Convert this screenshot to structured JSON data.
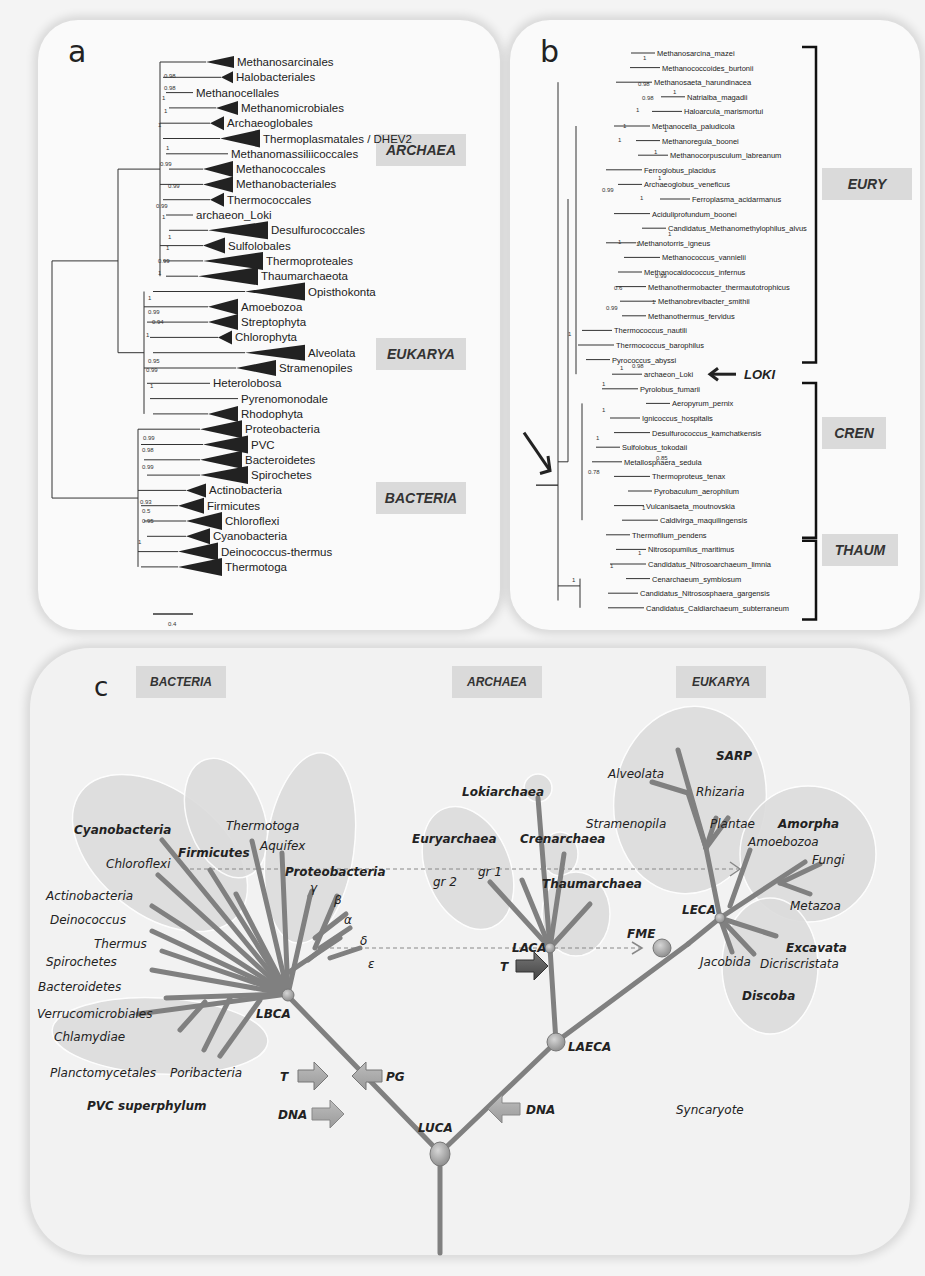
{
  "panel_a": {
    "letter": "a",
    "domains": [
      "ARCHAEA",
      "EUKARYA",
      "BACTERIA"
    ],
    "taxa": [
      "Methanosarcinales",
      "Halobacteriales",
      "Methanocellales",
      "Methanomicrobiales",
      "Archaeoglobales",
      "Thermoplasmatales / DHEV2",
      "Methanomassiliicoccales",
      "Methanococcales",
      "Methanobacteriales",
      "Thermococcales",
      "archaeon_Loki",
      "Desulfurococcales",
      "Sulfolobales",
      "Thermoproteales",
      "Thaumarchaeota",
      "Opisthokonta",
      "Amoebozoa",
      "Streptophyta",
      "Chlorophyta",
      "Alveolata",
      "Stramenopiles",
      "Heterolobosa",
      "Pyrenomonodale",
      "Rhodophyta",
      "Proteobacteria",
      "PVC",
      "Bacteroidetes",
      "Spirochetes",
      "Actinobacteria",
      "Firmicutes",
      "Chloroflexi",
      "Cyanobacteria",
      "Deinococcus-thermus",
      "Thermotoga"
    ],
    "supports": [
      "0.98",
      "0.98",
      "1",
      "1",
      "1",
      "1",
      "0.99",
      "0.99",
      "0.99",
      "1",
      "1",
      "1",
      "0.99",
      "1",
      "1",
      "0.99",
      "0.94",
      "1",
      "0.95",
      "0.99",
      "1",
      "0.99",
      "0.98",
      "0.99",
      "0.93",
      "0.5",
      "0.95",
      "1"
    ],
    "scale_label": "0.4"
  },
  "panel_b": {
    "letter": "b",
    "groups": [
      "EURY",
      "CREN",
      "THAUM"
    ],
    "loki_label": "LOKI",
    "taxa": [
      "Methanosarcina_mazei",
      "Methanococcoides_burtonii",
      "Methanosaeta_harundinacea",
      "Natrialba_magadii",
      "Haloarcula_marismortui",
      "Methanocella_paludicola",
      "Methanoregula_boonei",
      "Methanocorpusculum_labreanum",
      "Ferroglobus_placidus",
      "Archaeoglobus_veneficus",
      "Ferroplasma_acidarmanus",
      "Aciduliprofundum_boonei",
      "Candidatus_Methanomethylophilus_alvus",
      "Methanotorris_igneus",
      "Methanococcus_vannielii",
      "Methanocaldococcus_infernus",
      "Methanothermobacter_thermautotrophicus",
      "Methanobrevibacter_smithii",
      "Methanothermus_fervidus",
      "Thermococcus_nautili",
      "Thermococcus_barophilus",
      "Pyrococcus_abyssi",
      "archaeon_Loki",
      "Pyrolobus_fumarii",
      "Aeropyrum_pernix",
      "Ignicoccus_hospitalis",
      "Desulfurococcus_kamchatkensis",
      "Sulfolobus_tokodaii",
      "Metallosphaera_sedula",
      "Thermoproteus_tenax",
      "Pyrobaculum_aerophilum",
      "Vulcanisaeta_moutnovskia",
      "Caldivirga_maquilingensis",
      "Thermofilum_pendens",
      "Nitrosopumilus_maritimus",
      "Candidatus_Nitrosoarchaeum_limnia",
      "Cenarchaeum_symbiosum",
      "Candidatus_Nitrososphaera_gargensis",
      "Candidatus_Caldiarchaeum_subterraneum"
    ],
    "supports": [
      "1",
      "0.98",
      "0.98",
      "1",
      "1",
      "1",
      "1",
      "1",
      "1",
      "1",
      "1",
      "0.99",
      "1",
      "1",
      "1",
      "0.99",
      "0.6",
      "1",
      "0.99",
      "1",
      "0.98",
      "1",
      "1",
      "1",
      "1",
      "0.78",
      "0.85",
      "1",
      "1",
      "1",
      "1"
    ]
  },
  "panel_c": {
    "letter": "c",
    "domains": [
      "BACTERIA",
      "ARCHAEA",
      "EUKARYA"
    ],
    "bacteria_taxa": {
      "cyanobacteria": "Cyanobacteria",
      "chloroflexi": "Chloroflexi",
      "firmicutes": "Firmicutes",
      "thermotoga": "Thermotoga",
      "aquifex": "Aquifex",
      "proteobacteria": "Proteobacteria",
      "gamma": "γ",
      "beta": "β",
      "alpha": "α",
      "delta": "δ",
      "epsilon": "ε",
      "actinobacteria": "Actinobacteria",
      "deinococcus": "Deinococcus",
      "thermus": "Thermus",
      "spirochetes": "Spirochetes",
      "bacteroidetes": "Bacteroidetes",
      "verrucomicrobiales": "Verrucomicrobiales",
      "chlamydiae": "Chlamydiae",
      "planctomycetales": "Planctomycetales",
      "poribacteria": "Poribacteria",
      "pvc": "PVC superphylum"
    },
    "archaea_taxa": {
      "lokiarchaea": "Lokiarchaea",
      "euryarchaea": "Euryarchaea",
      "crenarchaea": "Crenarchaea",
      "gr1": "gr 1",
      "gr2": "gr 2",
      "thaumarchaea": "Thaumarchaea"
    },
    "eukarya_taxa": {
      "sarp": "SARP",
      "alveolata": "Alveolata",
      "rhizaria": "Rhizaria",
      "stramenopila": "Stramenopila",
      "plantae": "Plantae",
      "amorpha": "Amorpha",
      "amoebozoa": "Amoebozoa",
      "fungi": "Fungi",
      "metazoa": "Metazoa",
      "excavata": "Excavata",
      "jacobida": "Jacobida",
      "dicriscristata": "Dicriscristata",
      "discoba": "Discoba"
    },
    "nodes": {
      "lbca": "LBCA",
      "luca": "LUCA",
      "laca": "LACA",
      "laeca": "LAECA",
      "fme": "FME",
      "leca": "LECA"
    },
    "arrows": {
      "t_bact": "T",
      "pg": "PG",
      "dna_bact": "DNA",
      "t_arch": "T",
      "dna_arch": "DNA"
    },
    "syncaryote": "Syncaryote"
  }
}
